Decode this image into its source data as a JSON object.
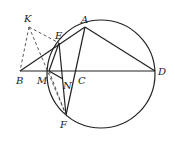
{
  "figure": {
    "type": "geometry",
    "circle": {
      "cx": 101,
      "cy": 74,
      "r": 54
    },
    "points": {
      "K": {
        "label": "K",
        "x": 29,
        "y": 27,
        "lx": 24,
        "ly": 22
      },
      "A": {
        "label": "A",
        "x": 85,
        "y": 27,
        "lx": 81,
        "ly": 23
      },
      "E": {
        "label": "E",
        "x": 59,
        "y": 43,
        "lx": 55,
        "ly": 39
      },
      "B": {
        "label": "B",
        "x": 20,
        "y": 71,
        "lx": 16,
        "ly": 84
      },
      "M": {
        "label": "M",
        "x": 49,
        "y": 71,
        "lx": 37,
        "ly": 84
      },
      "N": {
        "label": "N",
        "x": 63,
        "y": 79,
        "lx": 63,
        "ly": 89
      },
      "C": {
        "label": "C",
        "x": 77,
        "y": 71,
        "lx": 78,
        "ly": 84
      },
      "D": {
        "label": "D",
        "x": 155,
        "y": 71,
        "lx": 158,
        "ly": 75
      },
      "F": {
        "label": "F",
        "x": 66,
        "y": 115,
        "lx": 60,
        "ly": 128
      }
    },
    "solid_segments": [
      [
        "B",
        "D"
      ],
      [
        "B",
        "A"
      ],
      [
        "A",
        "D"
      ],
      [
        "A",
        "F"
      ],
      [
        "E",
        "F"
      ],
      [
        "E",
        "M"
      ],
      [
        "M",
        "N"
      ]
    ],
    "dashed_segments": [
      [
        "K",
        "B"
      ],
      [
        "K",
        "E"
      ],
      [
        "K",
        "F"
      ],
      [
        "M",
        "F"
      ]
    ]
  }
}
